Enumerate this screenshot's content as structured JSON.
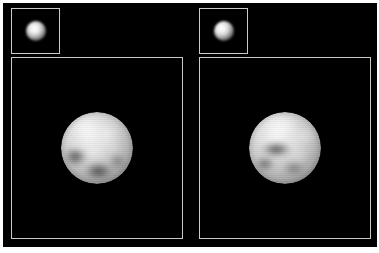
{
  "figure": {
    "background_color": "#ffffff",
    "plate_color": "#000000",
    "frame_color": "#c9c9c9",
    "width": 379,
    "height": 253
  },
  "panels": [
    {
      "id": "panel-left",
      "position": "left",
      "inset": {
        "name": "raw-observation-inset",
        "object_name": "unresolved-bright-disk",
        "background_color": "#000000",
        "border_color": "#c9c9c9"
      },
      "main": {
        "name": "reconstructed-disk-view",
        "object_name": "mottled-planetary-disk",
        "background_color": "#000000",
        "border_color": "#c9c9c9",
        "features": [
          "bright northern polar region",
          "dark patch lower-left limb",
          "dark equatorial-south band",
          "mid-latitude bright mottling"
        ]
      }
    },
    {
      "id": "panel-right",
      "position": "right",
      "inset": {
        "name": "raw-observation-inset",
        "object_name": "unresolved-bright-disk",
        "background_color": "#000000",
        "border_color": "#c9c9c9"
      },
      "main": {
        "name": "reconstructed-disk-view",
        "object_name": "banded-planetary-disk",
        "background_color": "#000000",
        "border_color": "#c9c9c9",
        "features": [
          "bright northern polar cap",
          "prominent dark equatorial band",
          "dark south-west region",
          "bright eastern limb"
        ]
      }
    }
  ]
}
